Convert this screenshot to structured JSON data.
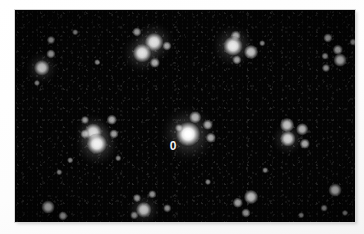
{
  "image": {
    "kind": "astronomical-star-field",
    "background_color": "#050505",
    "mount_color": "#ffffff",
    "star_color": "#ffffff",
    "label_color": "#f2f2f2",
    "plate": {
      "x": 15,
      "y": 10,
      "width": 340,
      "height": 212
    }
  },
  "annotations": [
    {
      "text": "0",
      "x": 173,
      "y": 146
    }
  ],
  "chart_data": {
    "type": "scatter",
    "title": "",
    "xlabel": "",
    "ylabel": "",
    "xlim": [
      0,
      340
    ],
    "ylim": [
      0,
      212
    ],
    "grid": false,
    "legend": null,
    "note": "Star field plate: each point is a detected source; size encodes relative brightness (0 = faintest, 10 = brightest).",
    "columns": [
      "x",
      "y",
      "brightness",
      "group"
    ],
    "points": [
      {
        "x": 36,
        "y": 30,
        "brightness": 2.0,
        "group": "left-chain"
      },
      {
        "x": 36,
        "y": 44,
        "brightness": 2.5,
        "group": "left-chain"
      },
      {
        "x": 27,
        "y": 58,
        "brightness": 5.5,
        "group": "left-chain"
      },
      {
        "x": 22,
        "y": 73,
        "brightness": 1.2,
        "group": "field"
      },
      {
        "x": 60,
        "y": 22,
        "brightness": 1.0,
        "group": "field"
      },
      {
        "x": 82,
        "y": 52,
        "brightness": 1.0,
        "group": "field"
      },
      {
        "x": 122,
        "y": 22,
        "brightness": 2.5,
        "group": "cluster-upper-left"
      },
      {
        "x": 139,
        "y": 32,
        "brightness": 6.5,
        "group": "cluster-upper-left"
      },
      {
        "x": 152,
        "y": 36,
        "brightness": 2.5,
        "group": "cluster-upper-left"
      },
      {
        "x": 127,
        "y": 43,
        "brightness": 6.5,
        "group": "cluster-upper-left"
      },
      {
        "x": 140,
        "y": 53,
        "brightness": 3.0,
        "group": "cluster-upper-left"
      },
      {
        "x": 221,
        "y": 26,
        "brightness": 3.0,
        "group": "cluster-upper-right"
      },
      {
        "x": 218,
        "y": 36,
        "brightness": 7.0,
        "group": "cluster-upper-right"
      },
      {
        "x": 236,
        "y": 42,
        "brightness": 4.5,
        "group": "cluster-upper-right"
      },
      {
        "x": 222,
        "y": 50,
        "brightness": 2.5,
        "group": "cluster-upper-right"
      },
      {
        "x": 247,
        "y": 33,
        "brightness": 1.0,
        "group": "field"
      },
      {
        "x": 313,
        "y": 28,
        "brightness": 2.5,
        "group": "right-chain"
      },
      {
        "x": 338,
        "y": 32,
        "brightness": 1.5,
        "group": "right-chain"
      },
      {
        "x": 323,
        "y": 40,
        "brightness": 3.0,
        "group": "right-chain"
      },
      {
        "x": 310,
        "y": 46,
        "brightness": 1.5,
        "group": "right-chain"
      },
      {
        "x": 325,
        "y": 50,
        "brightness": 4.0,
        "group": "right-chain"
      },
      {
        "x": 311,
        "y": 58,
        "brightness": 2.0,
        "group": "right-chain"
      },
      {
        "x": 70,
        "y": 110,
        "brightness": 2.0,
        "group": "cluster-mid-left"
      },
      {
        "x": 97,
        "y": 110,
        "brightness": 3.0,
        "group": "cluster-mid-left"
      },
      {
        "x": 78,
        "y": 122,
        "brightness": 6.0,
        "group": "cluster-mid-left"
      },
      {
        "x": 99,
        "y": 124,
        "brightness": 2.5,
        "group": "cluster-mid-left"
      },
      {
        "x": 70,
        "y": 124,
        "brightness": 2.5,
        "group": "cluster-mid-left"
      },
      {
        "x": 82,
        "y": 134,
        "brightness": 7.5,
        "group": "cluster-mid-left"
      },
      {
        "x": 180,
        "y": 107,
        "brightness": 3.5,
        "group": "cluster-center"
      },
      {
        "x": 193,
        "y": 115,
        "brightness": 3.0,
        "group": "cluster-center"
      },
      {
        "x": 173,
        "y": 124,
        "brightness": 9.0,
        "group": "cluster-center"
      },
      {
        "x": 196,
        "y": 128,
        "brightness": 3.0,
        "group": "cluster-center"
      },
      {
        "x": 164,
        "y": 118,
        "brightness": 2.0,
        "group": "cluster-center"
      },
      {
        "x": 272,
        "y": 115,
        "brightness": 4.5,
        "group": "cluster-mid-right"
      },
      {
        "x": 287,
        "y": 119,
        "brightness": 3.5,
        "group": "cluster-mid-right"
      },
      {
        "x": 273,
        "y": 129,
        "brightness": 5.5,
        "group": "cluster-mid-right"
      },
      {
        "x": 290,
        "y": 134,
        "brightness": 3.0,
        "group": "cluster-mid-right"
      },
      {
        "x": 44,
        "y": 162,
        "brightness": 1.0,
        "group": "field"
      },
      {
        "x": 193,
        "y": 172,
        "brightness": 1.2,
        "group": "field"
      },
      {
        "x": 122,
        "y": 188,
        "brightness": 2.0,
        "group": "cluster-lower-left"
      },
      {
        "x": 137,
        "y": 184,
        "brightness": 1.8,
        "group": "cluster-lower-left"
      },
      {
        "x": 129,
        "y": 200,
        "brightness": 5.5,
        "group": "cluster-lower-left"
      },
      {
        "x": 152,
        "y": 198,
        "brightness": 1.8,
        "group": "cluster-lower-left"
      },
      {
        "x": 119,
        "y": 205,
        "brightness": 1.8,
        "group": "cluster-lower-left"
      },
      {
        "x": 33,
        "y": 197,
        "brightness": 4.0,
        "group": "field"
      },
      {
        "x": 48,
        "y": 206,
        "brightness": 2.5,
        "group": "field"
      },
      {
        "x": 223,
        "y": 193,
        "brightness": 3.0,
        "group": "cluster-lower-right"
      },
      {
        "x": 236,
        "y": 187,
        "brightness": 4.5,
        "group": "cluster-lower-right"
      },
      {
        "x": 231,
        "y": 203,
        "brightness": 2.5,
        "group": "cluster-lower-right"
      },
      {
        "x": 320,
        "y": 180,
        "brightness": 4.0,
        "group": "field"
      },
      {
        "x": 309,
        "y": 198,
        "brightness": 1.5,
        "group": "field"
      },
      {
        "x": 330,
        "y": 203,
        "brightness": 1.2,
        "group": "field"
      },
      {
        "x": 286,
        "y": 205,
        "brightness": 1.0,
        "group": "field"
      },
      {
        "x": 250,
        "y": 160,
        "brightness": 1.0,
        "group": "field"
      },
      {
        "x": 103,
        "y": 148,
        "brightness": 1.0,
        "group": "field"
      },
      {
        "x": 55,
        "y": 150,
        "brightness": 1.0,
        "group": "field"
      }
    ]
  }
}
